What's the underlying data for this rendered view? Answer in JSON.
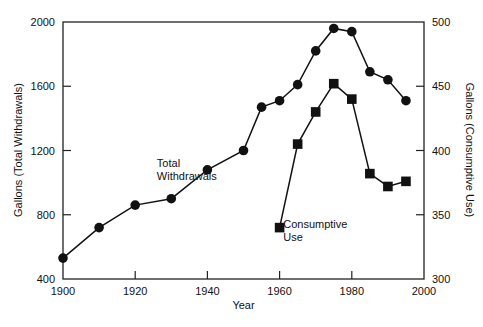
{
  "chart_data": {
    "type": "line",
    "title": "",
    "xlabel": "Year",
    "ylabel": "Gallons (Total Withdrawals)",
    "ylabel_right": "Gallons (Consumptive Use)",
    "xlim": [
      1900,
      2000
    ],
    "ylim": [
      400,
      2000
    ],
    "ylim_right": [
      300,
      500
    ],
    "x_ticks": [
      "1900",
      "1920",
      "1940",
      "1960",
      "1980",
      "2000"
    ],
    "y_ticks": [
      "400",
      "800",
      "1200",
      "1600",
      "2000"
    ],
    "y_ticks_right": [
      "300",
      "350",
      "400",
      "450",
      "500"
    ],
    "grid": false,
    "legend": "inline annotations",
    "series": [
      {
        "name": "Total Withdrawals",
        "axis": "left",
        "marker": "circle",
        "x": [
          1900,
          1910,
          1920,
          1930,
          1940,
          1950,
          1955,
          1960,
          1965,
          1970,
          1975,
          1980,
          1985,
          1990,
          1995
        ],
        "values": [
          530,
          720,
          860,
          900,
          1080,
          1200,
          1470,
          1510,
          1610,
          1820,
          1960,
          1940,
          1690,
          1640,
          1510
        ]
      },
      {
        "name": "Consumptive Use",
        "axis": "right",
        "marker": "square",
        "x": [
          1960,
          1965,
          1970,
          1975,
          1980,
          1985,
          1990,
          1995
        ],
        "values": [
          340,
          405,
          430,
          452,
          440,
          382,
          372,
          376
        ]
      }
    ],
    "annotations": [
      {
        "text": [
          "Total",
          "Withdrawals"
        ],
        "x": 1926,
        "y": 1100
      },
      {
        "text": [
          "Consumptive",
          "Use"
        ],
        "x": 1961,
        "y": 720
      }
    ]
  }
}
